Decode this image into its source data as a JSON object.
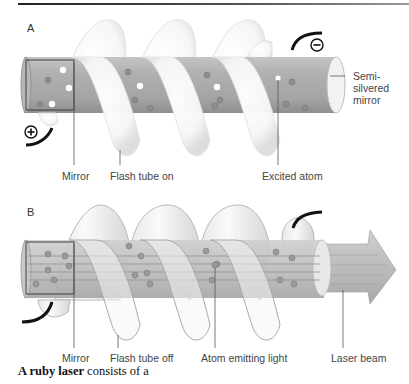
{
  "figure": {
    "panel_a": {
      "letter": "A",
      "labels": {
        "mirror": "Mirror",
        "flash_tube": "Flash tube on",
        "excited_atom": "Excited atom",
        "semi_silvered_mirror_line1": "Semi-",
        "semi_silvered_mirror_line2": "silvered",
        "semi_silvered_mirror_line3": "mirror"
      },
      "terminals": {
        "negative": "⊖",
        "positive": "⊕"
      }
    },
    "panel_b": {
      "letter": "B",
      "labels": {
        "mirror": "Mirror",
        "flash_tube": "Flash tube off",
        "atom_emitting": "Atom emitting light",
        "laser_beam": "Laser beam"
      }
    },
    "caption": {
      "bold": "A ruby laser",
      "rest": " consists of a"
    }
  }
}
